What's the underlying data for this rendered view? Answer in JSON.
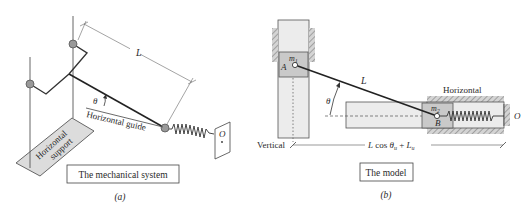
{
  "figure_a": {
    "caption": "(a)",
    "title_box": "The mechanical system",
    "support_label_line1": "Horizontal",
    "support_label_line2": "support",
    "guide_label": "Horizontal guide",
    "length_label": "L",
    "angle_label": "θ",
    "anchor_label": "O"
  },
  "figure_b": {
    "caption": "(b)",
    "title_box": "The model",
    "mass1_label": "m",
    "mass1_sub": "1",
    "point_a_label": "A",
    "mass2_label": "m",
    "mass2_sub": "2",
    "point_b_label": "B",
    "length_label": "L",
    "angle_label": "θ",
    "horizontal_label": "Horizontal",
    "vertical_label": "Vertical",
    "anchor_label": "O",
    "dimension_label_L": "L",
    "dimension_label_cos": " cos ",
    "dimension_label_theta": "θ",
    "dimension_label_sub_u": "u",
    "dimension_label_plus": " + ",
    "dimension_label_Lu": "L",
    "dimension_label_Lu_sub": "u"
  },
  "colors": {
    "line": "#2a2a2a",
    "thin_line": "#555555",
    "mass_fill": "#c9c9c9",
    "guide_fill": "#ececec",
    "ground_hatch": "#8a8a8a",
    "joint_fill": "#9a9a9a",
    "support_fill": "#dcdcdc"
  }
}
